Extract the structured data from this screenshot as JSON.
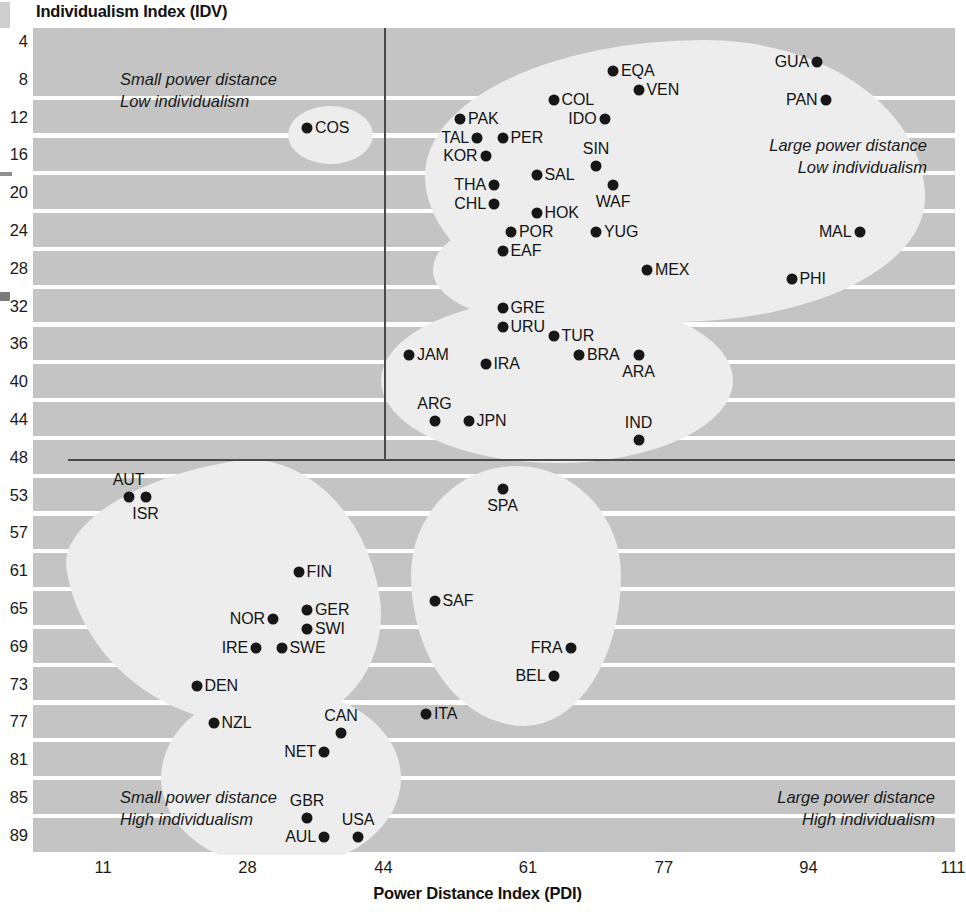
{
  "chart": {
    "title": "Individualism Index (IDV)",
    "xlabel": "Power Distance Index (PDI)"
  },
  "annotations": {
    "top_left_line1": "Small power distance",
    "top_left_line2": "Low individualism",
    "top_right_line1": "Large power distance",
    "top_right_line2": "Low individualism",
    "bottom_left_line1": "Small power distance",
    "bottom_left_line2": "High individualism",
    "bottom_right_line1": "Large power distance",
    "bottom_right_line2": "High individualism"
  },
  "chart_data": {
    "type": "scatter",
    "title": "Individualism Index (IDV)",
    "xlabel": "Power Distance Index (PDI)",
    "ylabel": "Individualism Index (IDV)",
    "grid": true,
    "legend": false,
    "xlim": [
      11,
      111
    ],
    "ylim": [
      4,
      89
    ],
    "y_axis_inverted": true,
    "xticks": [
      11,
      28,
      44,
      61,
      77,
      94,
      111
    ],
    "yticks": [
      4,
      8,
      12,
      16,
      20,
      24,
      28,
      32,
      36,
      40,
      44,
      48,
      53,
      57,
      61,
      65,
      69,
      73,
      77,
      81,
      85,
      89
    ],
    "quadrant_divider_x": 44,
    "quadrant_divider_y": 48,
    "accent_color": "#171717",
    "band_color": "#c4c4c4",
    "blob_color": "#ededed",
    "points": [
      {
        "label": "COS",
        "x": 35,
        "y": 13,
        "label_pos": "r"
      },
      {
        "label": "EQA",
        "x": 71,
        "y": 7,
        "label_pos": "r"
      },
      {
        "label": "GUA",
        "x": 95,
        "y": 6,
        "label_pos": "l"
      },
      {
        "label": "COL",
        "x": 64,
        "y": 10,
        "label_pos": "r"
      },
      {
        "label": "VEN",
        "x": 74,
        "y": 9,
        "label_pos": "r"
      },
      {
        "label": "PAN",
        "x": 96,
        "y": 10,
        "label_pos": "l"
      },
      {
        "label": "PAK",
        "x": 53,
        "y": 12,
        "label_pos": "r"
      },
      {
        "label": "IDO",
        "x": 70,
        "y": 12,
        "label_pos": "l"
      },
      {
        "label": "TAL",
        "x": 55,
        "y": 14,
        "label_pos": "l"
      },
      {
        "label": "PER",
        "x": 58,
        "y": 14,
        "label_pos": "r"
      },
      {
        "label": "KOR",
        "x": 56,
        "y": 16,
        "label_pos": "l"
      },
      {
        "label": "SIN",
        "x": 69,
        "y": 17,
        "label_pos": "above"
      },
      {
        "label": "SAL",
        "x": 62,
        "y": 18,
        "label_pos": "r"
      },
      {
        "label": "THA",
        "x": 57,
        "y": 19,
        "label_pos": "l"
      },
      {
        "label": "WAF",
        "x": 71,
        "y": 19,
        "label_pos": "below"
      },
      {
        "label": "CHL",
        "x": 57,
        "y": 21,
        "label_pos": "l"
      },
      {
        "label": "HOK",
        "x": 62,
        "y": 22,
        "label_pos": "r"
      },
      {
        "label": "POR",
        "x": 59,
        "y": 24,
        "label_pos": "r"
      },
      {
        "label": "YUG",
        "x": 69,
        "y": 24,
        "label_pos": "r"
      },
      {
        "label": "MAL",
        "x": 100,
        "y": 24,
        "label_pos": "l"
      },
      {
        "label": "EAF",
        "x": 58,
        "y": 26,
        "label_pos": "r"
      },
      {
        "label": "MEX",
        "x": 75,
        "y": 28,
        "label_pos": "r"
      },
      {
        "label": "PHI",
        "x": 92,
        "y": 29,
        "label_pos": "r"
      },
      {
        "label": "GRE",
        "x": 58,
        "y": 32,
        "label_pos": "r"
      },
      {
        "label": "URU",
        "x": 58,
        "y": 34,
        "label_pos": "r"
      },
      {
        "label": "TUR",
        "x": 64,
        "y": 35,
        "label_pos": "r"
      },
      {
        "label": "JAM",
        "x": 47,
        "y": 37,
        "label_pos": "r"
      },
      {
        "label": "BRA",
        "x": 67,
        "y": 37,
        "label_pos": "r"
      },
      {
        "label": "ARA",
        "x": 74,
        "y": 37,
        "label_pos": "below"
      },
      {
        "label": "IRA",
        "x": 56,
        "y": 38,
        "label_pos": "r"
      },
      {
        "label": "ARG",
        "x": 50,
        "y": 44,
        "label_pos": "above"
      },
      {
        "label": "JPN",
        "x": 54,
        "y": 44,
        "label_pos": "r"
      },
      {
        "label": "IND",
        "x": 74,
        "y": 46,
        "label_pos": "above"
      },
      {
        "label": "AUT",
        "x": 14,
        "y": 53,
        "label_pos": "above"
      },
      {
        "label": "ISR",
        "x": 16,
        "y": 53,
        "label_pos": "below"
      },
      {
        "label": "SPA",
        "x": 58,
        "y": 52,
        "label_pos": "below"
      },
      {
        "label": "FIN",
        "x": 34,
        "y": 61,
        "label_pos": "r"
      },
      {
        "label": "SAF",
        "x": 50,
        "y": 64,
        "label_pos": "r"
      },
      {
        "label": "GER",
        "x": 35,
        "y": 65,
        "label_pos": "r"
      },
      {
        "label": "NOR",
        "x": 31,
        "y": 66,
        "label_pos": "l"
      },
      {
        "label": "SWI",
        "x": 35,
        "y": 67,
        "label_pos": "r"
      },
      {
        "label": "IRE",
        "x": 29,
        "y": 69,
        "label_pos": "l"
      },
      {
        "label": "SWE",
        "x": 32,
        "y": 69,
        "label_pos": "r"
      },
      {
        "label": "FRA",
        "x": 66,
        "y": 69,
        "label_pos": "l"
      },
      {
        "label": "BEL",
        "x": 64,
        "y": 72,
        "label_pos": "l"
      },
      {
        "label": "DEN",
        "x": 22,
        "y": 73,
        "label_pos": "r"
      },
      {
        "label": "ITA",
        "x": 49,
        "y": 76,
        "label_pos": "r"
      },
      {
        "label": "NZL",
        "x": 24,
        "y": 77,
        "label_pos": "r"
      },
      {
        "label": "CAN",
        "x": 39,
        "y": 78,
        "label_pos": "above"
      },
      {
        "label": "NET",
        "x": 37,
        "y": 80,
        "label_pos": "l"
      },
      {
        "label": "GBR",
        "x": 35,
        "y": 87,
        "label_pos": "above"
      },
      {
        "label": "USA",
        "x": 41,
        "y": 89,
        "label_pos": "above"
      },
      {
        "label": "AUL",
        "x": 37,
        "y": 89,
        "label_pos": "l"
      }
    ]
  }
}
